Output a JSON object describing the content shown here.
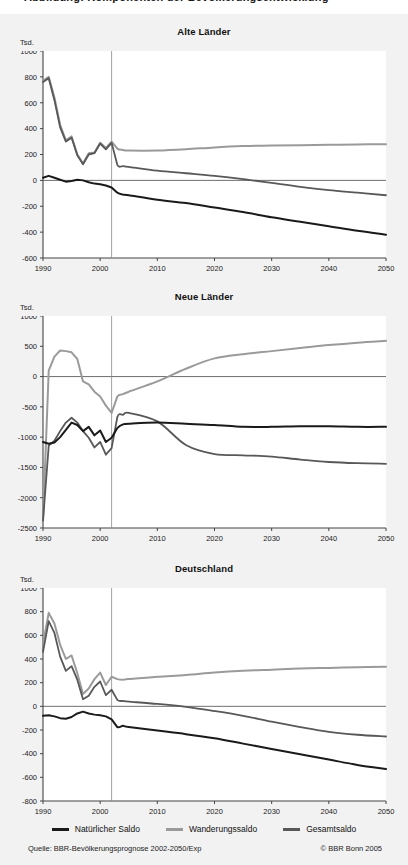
{
  "header": {
    "clipped_caption": "Abbildung: Komponenten der Bevölkerungsentwicklung"
  },
  "colors": {
    "natuerlicher_saldo": "#1a1a1a",
    "wanderungssaldo": "#9a9a9a",
    "gesamtsaldo": "#585858",
    "axis": "#555555",
    "plot_background": "#ffffff",
    "page_background": "#f2f2f2"
  },
  "legend": {
    "items": [
      {
        "label": "Natürlicher Saldo",
        "color": "#1a1a1a"
      },
      {
        "label": "Wanderungssaldo",
        "color": "#9a9a9a"
      },
      {
        "label": "Gesamtsaldo",
        "color": "#585858"
      }
    ]
  },
  "footer": {
    "source": "Quelle: BBR-Bevölkerungsprognose 2002-2050/Exp",
    "copyright": "© BBR Bonn 2005"
  },
  "chart_data": [
    {
      "type": "line",
      "title": "Alte Länder",
      "ylabel": "Tsd.",
      "xlabel": "",
      "xlim": [
        1990,
        2050
      ],
      "ylim": [
        -600,
        1000
      ],
      "yticks": [
        1000,
        800,
        600,
        400,
        200,
        0,
        -200,
        -400,
        -600
      ],
      "xticks": [
        1990,
        2000,
        2010,
        2020,
        2030,
        2040,
        2050
      ],
      "grid": false,
      "zero_line": true,
      "forecast_divider_x": 2002,
      "legend_position": "bottom-shared",
      "x": [
        1990,
        1991,
        1992,
        1993,
        1994,
        1995,
        1996,
        1997,
        1998,
        1999,
        2000,
        2001,
        2002,
        2003,
        2004,
        2005,
        2010,
        2015,
        2020,
        2025,
        2030,
        2035,
        2040,
        2045,
        2050
      ],
      "series": [
        {
          "name": "Natürlicher Saldo",
          "values": [
            20,
            35,
            20,
            5,
            -10,
            -5,
            5,
            0,
            -15,
            -25,
            -30,
            -40,
            -55,
            -95,
            -110,
            -115,
            -150,
            -175,
            -210,
            -245,
            -285,
            -320,
            -355,
            -390,
            -420
          ]
        },
        {
          "name": "Wanderungssaldo",
          "values": [
            770,
            800,
            640,
            430,
            310,
            340,
            200,
            130,
            210,
            215,
            290,
            250,
            300,
            245,
            235,
            230,
            230,
            240,
            255,
            265,
            270,
            272,
            275,
            278,
            280
          ]
        },
        {
          "name": "Gesamtsaldo",
          "values": [
            760,
            790,
            620,
            410,
            300,
            330,
            195,
            125,
            200,
            210,
            285,
            240,
            290,
            120,
            110,
            105,
            75,
            55,
            35,
            10,
            -20,
            -50,
            -75,
            -95,
            -115
          ]
        }
      ]
    },
    {
      "type": "line",
      "title": "Neue Länder",
      "ylabel": "Tsd.",
      "xlabel": "",
      "xlim": [
        1990,
        2050
      ],
      "ylim": [
        -2500,
        1000
      ],
      "yticks": [
        1000,
        500,
        0,
        -500,
        -1000,
        -1500,
        -2000,
        -2500
      ],
      "xticks": [
        1990,
        2000,
        2010,
        2020,
        2030,
        2040,
        2050
      ],
      "grid": false,
      "zero_line": true,
      "forecast_divider_x": 2002,
      "legend_position": "bottom-shared",
      "x": [
        1990,
        1991,
        1992,
        1993,
        1994,
        1995,
        1996,
        1997,
        1998,
        1999,
        2000,
        2001,
        2002,
        2003,
        2004,
        2005,
        2010,
        2015,
        2020,
        2025,
        2030,
        2035,
        2040,
        2045,
        2050
      ],
      "series": [
        {
          "name": "Natürlicher Saldo",
          "values": [
            -1080,
            -1110,
            -1090,
            -1000,
            -880,
            -760,
            -800,
            -900,
            -830,
            -970,
            -890,
            -1080,
            -1010,
            -850,
            -790,
            -780,
            -760,
            -780,
            -800,
            -830,
            -830,
            -820,
            -820,
            -830,
            -830
          ]
        },
        {
          "name": "Wanderungssaldo",
          "values": [
            -2380,
            100,
            330,
            430,
            420,
            400,
            290,
            -80,
            -130,
            -250,
            -330,
            -480,
            -600,
            -330,
            -290,
            -250,
            -80,
            130,
            300,
            370,
            420,
            470,
            520,
            560,
            590
          ]
        },
        {
          "name": "Gesamtsaldo",
          "values": [
            -2380,
            -1140,
            -1060,
            -900,
            -760,
            -680,
            -760,
            -900,
            -1010,
            -1170,
            -1080,
            -1290,
            -1180,
            -670,
            -630,
            -600,
            -740,
            -1130,
            -1280,
            -1300,
            -1320,
            -1370,
            -1410,
            -1430,
            -1440
          ]
        }
      ]
    },
    {
      "type": "line",
      "title": "Deutschland",
      "ylabel": "Tsd.",
      "xlabel": "",
      "xlim": [
        1990,
        2050
      ],
      "ylim": [
        -800,
        1000
      ],
      "yticks": [
        1000,
        800,
        600,
        400,
        200,
        0,
        -200,
        -400,
        -600,
        -800
      ],
      "xticks": [
        1990,
        2000,
        2010,
        2020,
        2030,
        2040,
        2050
      ],
      "grid": false,
      "zero_line": true,
      "forecast_divider_x": 2002,
      "legend_position": "bottom-shared",
      "x": [
        1990,
        1991,
        1992,
        1993,
        1994,
        1995,
        1996,
        1997,
        1998,
        1999,
        2000,
        2001,
        2002,
        2003,
        2004,
        2005,
        2010,
        2015,
        2020,
        2025,
        2030,
        2035,
        2040,
        2045,
        2050
      ],
      "series": [
        {
          "name": "Natürlicher Saldo",
          "values": [
            -80,
            -75,
            -85,
            -100,
            -105,
            -90,
            -60,
            -45,
            -60,
            -70,
            -75,
            -85,
            -110,
            -175,
            -165,
            -175,
            -205,
            -235,
            -270,
            -315,
            -360,
            -405,
            -450,
            -495,
            -530
          ]
        },
        {
          "name": "Wanderungssaldo",
          "values": [
            530,
            790,
            700,
            520,
            400,
            430,
            280,
            105,
            150,
            230,
            285,
            180,
            250,
            230,
            225,
            230,
            250,
            265,
            285,
            300,
            310,
            320,
            325,
            330,
            335
          ]
        },
        {
          "name": "Gesamtsaldo",
          "values": [
            460,
            720,
            620,
            420,
            300,
            340,
            225,
            60,
            90,
            165,
            210,
            95,
            140,
            55,
            45,
            40,
            20,
            -5,
            -40,
            -80,
            -130,
            -175,
            -215,
            -240,
            -255
          ]
        }
      ]
    }
  ]
}
